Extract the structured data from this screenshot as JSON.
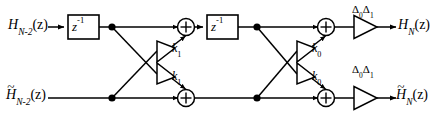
{
  "figure": {
    "type": "signal-flow-diagram",
    "width": 445,
    "height": 118,
    "background_color": "#ffffff",
    "line_color": "#000000"
  },
  "labels": {
    "input_top": {
      "base": "H",
      "sub": "N-2",
      "arg": "(z)",
      "tilde": false,
      "text": "H_{N-2}(z)"
    },
    "input_bottom": {
      "base": "H",
      "sub": "N-2",
      "arg": "(z)",
      "tilde": true,
      "text": "H~_{N-2}(z)"
    },
    "output_top": {
      "base": "H",
      "sub": "N",
      "arg": "(z)",
      "tilde": false,
      "text": "H_N(z)"
    },
    "output_bottom": {
      "base": "H",
      "sub": "N",
      "arg": "(z)",
      "tilde": true,
      "text": "H~_N(z)"
    },
    "delay_block_1": {
      "base": "z",
      "sup": "-1",
      "text": "z^-1"
    },
    "delay_block_2": {
      "base": "z",
      "sup": "-1",
      "text": "z^-1"
    },
    "gain_k1_upper": {
      "base": "k",
      "sub": "1",
      "text": "k1"
    },
    "gain_k1_lower": {
      "base": "k",
      "sub": "1",
      "text": "k1"
    },
    "gain_k0_upper": {
      "base": "k",
      "sub": "0",
      "text": "k0"
    },
    "gain_k0_lower": {
      "base": "k",
      "sub": "0",
      "text": "k0"
    },
    "gain_delta_top": {
      "first": "Δ",
      "first_sub": "0",
      "second": "Δ",
      "second_sub": "1",
      "text": "Δ0Δ1"
    },
    "gain_delta_bottom": {
      "first": "Δ",
      "first_sub": "0",
      "second": "Δ",
      "second_sub": "1",
      "text": "Δ0Δ1"
    }
  },
  "adders": {
    "symbol": "+",
    "count": 4,
    "names": [
      "adder-top-left",
      "adder-bottom-left",
      "adder-top-right",
      "adder-bottom-right"
    ]
  },
  "nodes": {
    "count": 4,
    "names": [
      "node-top-left",
      "node-bottom-left",
      "node-top-right",
      "node-bottom-right"
    ]
  }
}
